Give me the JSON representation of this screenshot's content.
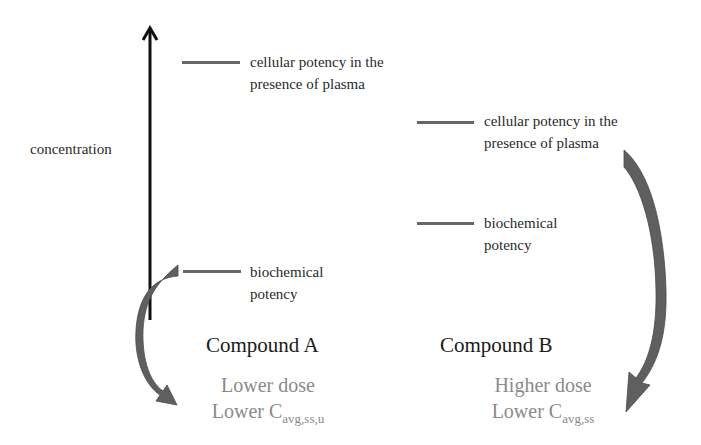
{
  "diagram": {
    "axis_label": "concentration",
    "compound_a": {
      "title": "Compound A",
      "cellular_potency_label_line1": "cellular potency in the",
      "cellular_potency_label_line2": "presence of plasma",
      "biochemical_potency_label_line1": "biochemical",
      "biochemical_potency_label_line2": "potency",
      "outcome_line1": "Lower dose",
      "outcome_line2_main": "Lower C",
      "outcome_line2_sub": "avg,ss,u"
    },
    "compound_b": {
      "title": "Compound B",
      "cellular_potency_label_line1": "cellular potency in the",
      "cellular_potency_label_line2": "presence of plasma",
      "biochemical_potency_label_line1": "biochemical",
      "biochemical_potency_label_line2": "potency",
      "outcome_line1": "Higher dose",
      "outcome_line2_main": "Lower C",
      "outcome_line2_sub": "avg,ss"
    },
    "colors": {
      "axis": "#111111",
      "tick": "#666666",
      "curved_arrow": "#5f5f5f",
      "outcome_text": "#8a8a8a"
    }
  }
}
